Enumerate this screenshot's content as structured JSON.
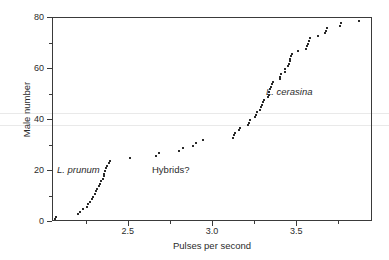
{
  "figure": {
    "width": 389,
    "height": 260,
    "background": "#ffffff",
    "point_color": "#2a2a2a",
    "axis_color": "#3a3a3a"
  },
  "chart_data": {
    "type": "scatter",
    "title": "",
    "xlabel": "Pulses per second",
    "ylabel": "Male number",
    "xlim": [
      2.05,
      3.95
    ],
    "ylim": [
      0,
      80
    ],
    "grid": false,
    "legend_position": "none",
    "x_ticks": [
      2.5,
      3.0,
      3.5
    ],
    "x_tick_labels": [
      "2.5",
      "3.0",
      "3.5"
    ],
    "x_minor_ticks": [
      2.25,
      2.75,
      3.25,
      3.75
    ],
    "y_ticks": [
      0,
      20,
      40,
      60,
      80
    ],
    "y_tick_labels": [
      "0",
      "20",
      "40",
      "60",
      "80"
    ],
    "y_minor_ticks": [
      10,
      30,
      50,
      70
    ],
    "annotations": [
      {
        "text": "L. prunum",
        "x": 2.09,
        "y": 21,
        "style": "italic"
      },
      {
        "text": "Hybrids?",
        "x": 2.68,
        "y": 21,
        "style": "normal"
      },
      {
        "text": "L. cerasina",
        "x": 3.4,
        "y": 51,
        "style": "italic"
      }
    ],
    "series": [
      {
        "name": "Laupala males ranked by pulse rate",
        "points": [
          [
            2.06,
            1
          ],
          [
            2.07,
            2
          ],
          [
            2.2,
            3
          ],
          [
            2.21,
            4
          ],
          [
            2.23,
            5
          ],
          [
            2.25,
            6
          ],
          [
            2.26,
            7
          ],
          [
            2.27,
            8
          ],
          [
            2.28,
            9
          ],
          [
            2.285,
            10
          ],
          [
            2.3,
            11
          ],
          [
            2.305,
            12
          ],
          [
            2.31,
            13
          ],
          [
            2.325,
            14
          ],
          [
            2.33,
            15
          ],
          [
            2.335,
            16
          ],
          [
            2.345,
            17
          ],
          [
            2.35,
            18
          ],
          [
            2.355,
            19
          ],
          [
            2.36,
            20
          ],
          [
            2.365,
            21
          ],
          [
            2.37,
            22
          ],
          [
            2.385,
            23
          ],
          [
            2.39,
            24
          ],
          [
            2.51,
            25
          ],
          [
            2.66,
            26
          ],
          [
            2.68,
            27
          ],
          [
            2.8,
            28
          ],
          [
            2.82,
            29
          ],
          [
            2.88,
            30
          ],
          [
            2.9,
            31
          ],
          [
            2.94,
            32
          ],
          [
            3.12,
            33
          ],
          [
            3.125,
            34
          ],
          [
            3.13,
            35
          ],
          [
            3.155,
            36
          ],
          [
            3.16,
            37
          ],
          [
            3.21,
            38
          ],
          [
            3.215,
            39
          ],
          [
            3.22,
            40
          ],
          [
            3.25,
            41
          ],
          [
            3.255,
            42
          ],
          [
            3.26,
            43
          ],
          [
            3.28,
            44
          ],
          [
            3.285,
            45
          ],
          [
            3.29,
            46
          ],
          [
            3.295,
            47
          ],
          [
            3.3,
            48
          ],
          [
            3.325,
            49
          ],
          [
            3.33,
            50
          ],
          [
            3.335,
            51
          ],
          [
            3.34,
            52
          ],
          [
            3.345,
            53
          ],
          [
            3.35,
            54
          ],
          [
            3.355,
            55
          ],
          [
            3.395,
            56
          ],
          [
            3.4,
            57
          ],
          [
            3.405,
            58
          ],
          [
            3.425,
            59
          ],
          [
            3.43,
            60
          ],
          [
            3.445,
            61
          ],
          [
            3.45,
            62
          ],
          [
            3.455,
            63
          ],
          [
            3.46,
            64
          ],
          [
            3.465,
            65
          ],
          [
            3.47,
            66
          ],
          [
            3.505,
            67
          ],
          [
            3.555,
            68
          ],
          [
            3.56,
            69
          ],
          [
            3.565,
            70
          ],
          [
            3.57,
            71
          ],
          [
            3.575,
            72
          ],
          [
            3.625,
            73
          ],
          [
            3.665,
            74
          ],
          [
            3.67,
            75
          ],
          [
            3.675,
            76
          ],
          [
            3.755,
            77
          ],
          [
            3.76,
            78
          ],
          [
            3.865,
            79
          ]
        ]
      }
    ]
  }
}
